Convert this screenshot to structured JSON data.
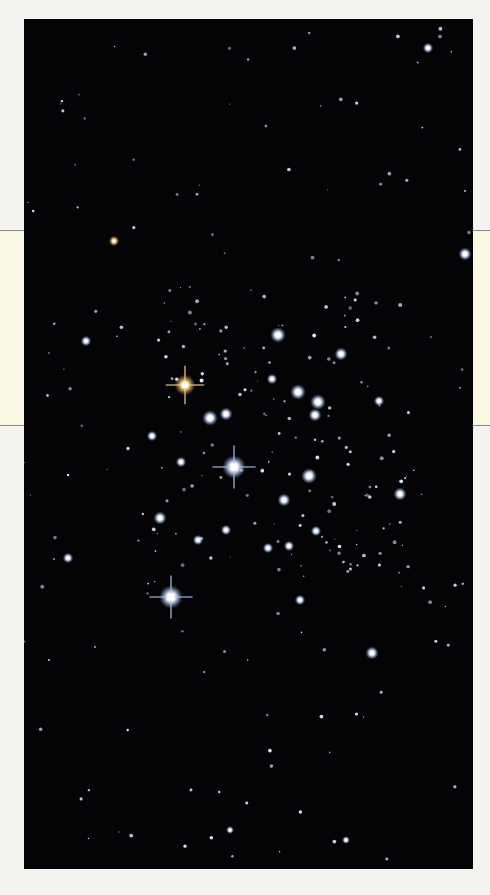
{
  "page": {
    "background": "#f4f3ef",
    "band_color": "#faf8e2",
    "band_top": 230,
    "band_bottom": 425
  },
  "photo": {
    "subject": "open star cluster starfield",
    "background": "#040306",
    "x": 24,
    "y": 19,
    "width": 449,
    "height": 850,
    "bright_stars": [
      {
        "x": 234,
        "y": 467,
        "r": 9,
        "spikes": true,
        "color": "#eef4ff"
      },
      {
        "x": 171,
        "y": 597,
        "r": 9,
        "spikes": true,
        "color": "#e6efff"
      },
      {
        "x": 185,
        "y": 385,
        "r": 8,
        "spikes": true,
        "color": "#f0cf8a"
      },
      {
        "x": 210,
        "y": 418,
        "r": 6,
        "color": "#e6efff"
      },
      {
        "x": 226,
        "y": 414,
        "r": 5,
        "color": "#e6efff"
      },
      {
        "x": 278,
        "y": 335,
        "r": 6,
        "color": "#e6efff"
      },
      {
        "x": 298,
        "y": 392,
        "r": 6,
        "color": "#e6efff"
      },
      {
        "x": 318,
        "y": 402,
        "r": 6,
        "color": "#e6efff"
      },
      {
        "x": 315,
        "y": 415,
        "r": 5,
        "color": "#e6efff"
      },
      {
        "x": 341,
        "y": 354,
        "r": 5,
        "color": "#e6efff"
      },
      {
        "x": 309,
        "y": 476,
        "r": 6,
        "color": "#e6efff"
      },
      {
        "x": 284,
        "y": 500,
        "r": 5,
        "color": "#e6efff"
      },
      {
        "x": 160,
        "y": 518,
        "r": 5,
        "color": "#e6efff"
      },
      {
        "x": 400,
        "y": 494,
        "r": 5,
        "color": "#e6efff"
      },
      {
        "x": 465,
        "y": 254,
        "r": 5,
        "color": "#e6efff"
      },
      {
        "x": 372,
        "y": 653,
        "r": 5,
        "color": "#e6efff"
      },
      {
        "x": 68,
        "y": 558,
        "r": 4,
        "color": "#e6efff"
      },
      {
        "x": 272,
        "y": 379,
        "r": 4,
        "color": "#e6efff"
      },
      {
        "x": 198,
        "y": 540,
        "r": 4,
        "color": "#e6efff"
      },
      {
        "x": 226,
        "y": 530,
        "r": 4,
        "color": "#e6efff"
      },
      {
        "x": 316,
        "y": 531,
        "r": 4,
        "color": "#e6efff"
      },
      {
        "x": 300,
        "y": 600,
        "r": 4,
        "color": "#e6efff"
      },
      {
        "x": 86,
        "y": 341,
        "r": 4,
        "color": "#e6efff"
      },
      {
        "x": 114,
        "y": 241,
        "r": 4,
        "color": "#f0d9a8"
      },
      {
        "x": 428,
        "y": 48,
        "r": 4,
        "color": "#e6efff"
      },
      {
        "x": 379,
        "y": 401,
        "r": 4,
        "color": "#e6efff"
      },
      {
        "x": 152,
        "y": 436,
        "r": 4,
        "color": "#e6efff"
      },
      {
        "x": 181,
        "y": 462,
        "r": 4,
        "color": "#e6efff"
      },
      {
        "x": 268,
        "y": 548,
        "r": 4,
        "color": "#e6efff"
      },
      {
        "x": 289,
        "y": 546,
        "r": 4,
        "color": "#e6efff"
      },
      {
        "x": 230,
        "y": 830,
        "r": 3,
        "color": "#e6efff"
      },
      {
        "x": 346,
        "y": 840,
        "r": 3,
        "color": "#e6efff"
      }
    ]
  }
}
